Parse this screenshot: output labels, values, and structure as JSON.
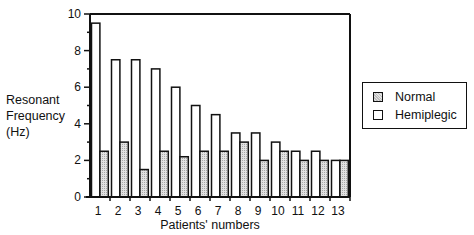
{
  "chart_data": {
    "type": "bar",
    "title": "",
    "xlabel": "Patients' numbers",
    "ylabel": "Resonant Frequency (Hz)",
    "ylabel_lines": [
      "Resonant",
      "Frequency",
      "(Hz)"
    ],
    "ylim": [
      0,
      10
    ],
    "yticks": [
      0,
      2,
      4,
      6,
      8,
      10
    ],
    "categories": [
      "1",
      "2",
      "3",
      "4",
      "5",
      "6",
      "7",
      "8",
      "9",
      "10",
      "11",
      "12",
      "13"
    ],
    "series": [
      {
        "name": "Hemiplegic",
        "fill": "#ffffff",
        "values": [
          9.5,
          7.5,
          7.5,
          7.0,
          6.0,
          5.0,
          4.5,
          3.5,
          3.5,
          3.0,
          2.5,
          2.5,
          2.0
        ]
      },
      {
        "name": "Normal",
        "fill": "#cccccc",
        "values": [
          2.5,
          3.0,
          1.5,
          2.5,
          2.2,
          2.5,
          2.5,
          3.0,
          2.0,
          2.5,
          2.0,
          2.0,
          2.0
        ]
      }
    ],
    "legend": {
      "position": "right",
      "entries": [
        "Normal",
        "Hemiplegic"
      ]
    },
    "grid": false
  },
  "legend": {
    "normal": "Normal",
    "hemiplegic": "Hemiplegic"
  }
}
